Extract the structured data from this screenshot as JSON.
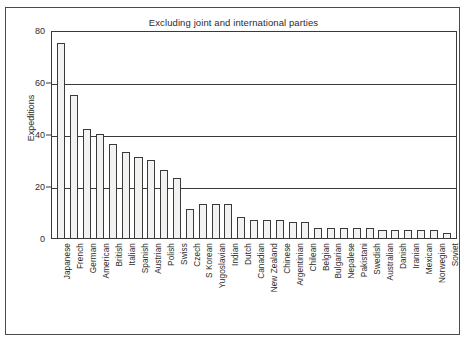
{
  "chart_data": {
    "type": "bar",
    "title": "Excluding joint and international parties",
    "xlabel": "",
    "ylabel": "Expeditions",
    "ylim": [
      0,
      80
    ],
    "yticks": [
      0,
      20,
      40,
      60,
      80
    ],
    "grid": true,
    "legend": null,
    "categories": [
      "Japanese",
      "French",
      "German",
      "American",
      "British",
      "Italian",
      "Spanish",
      "Austrian",
      "Polish",
      "Swiss",
      "Czech",
      "S Korean",
      "Yugoslavian",
      "Indian",
      "Dutch",
      "Canadian",
      "New Zealand",
      "Chinese",
      "Argentinian",
      "Chilean",
      "Belgian",
      "Bulgarian",
      "Nepalese",
      "Pakistani",
      "Swedish",
      "Australian",
      "Danish",
      "Iranian",
      "Mexican",
      "Norwegian",
      "Soviet"
    ],
    "values": [
      75,
      55,
      42,
      40,
      36,
      33,
      31,
      30,
      26,
      23,
      11,
      13,
      13,
      13,
      8,
      7,
      7,
      7,
      6,
      6,
      4,
      4,
      4,
      4,
      4,
      3,
      3,
      3,
      3,
      3,
      2
    ]
  }
}
